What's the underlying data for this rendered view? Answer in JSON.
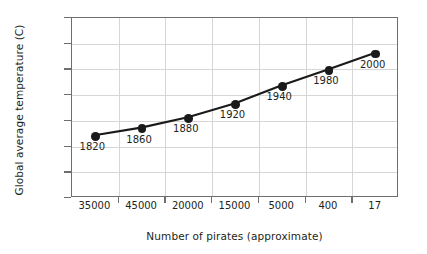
{
  "chart_data": {
    "type": "line",
    "title": "",
    "xlabel": "Number of pirates (approximate)",
    "ylabel": "Global average temperature (C)",
    "categories": [
      "35000",
      "45000",
      "20000",
      "15000",
      "5000",
      "400",
      "17"
    ],
    "point_labels": [
      "1820",
      "1860",
      "1880",
      "1920",
      "1940",
      "1980",
      "2000"
    ],
    "values": [
      14.2,
      14.35,
      14.55,
      14.82,
      15.17,
      15.48,
      15.8
    ],
    "ylim": [
      13,
      16.5
    ],
    "ytick_labels": [
      "13",
      "13.5",
      "14",
      "14.5",
      "15",
      "15.5",
      "16",
      "16.5"
    ],
    "ytick_values": [
      13,
      13.5,
      14,
      14.5,
      15,
      15.5,
      16,
      16.5
    ],
    "grid": true,
    "legend": "none",
    "marker": "filled-circle",
    "series_color": "#1a1a1a",
    "grid_color": "#d6d6d6",
    "axis_color": "#6e6e6e",
    "background_color": "#ffffff"
  }
}
